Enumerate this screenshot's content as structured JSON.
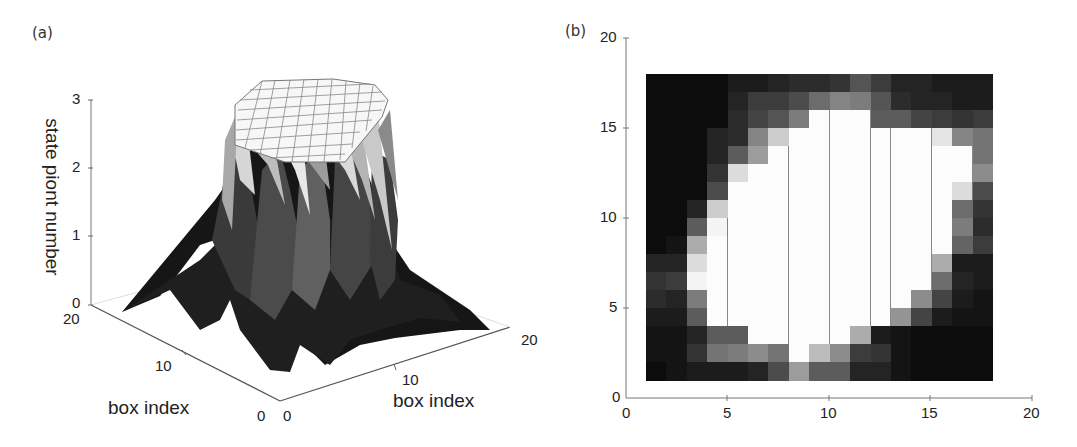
{
  "chart_data": [
    {
      "type": "surface3d",
      "panel": "(a)",
      "title": "",
      "xlabel": "box index",
      "ylabel": "box index",
      "zlabel": "state piont number",
      "x_ticks": [
        "0",
        "10",
        "20"
      ],
      "y_ticks": [
        "0",
        "10",
        "20"
      ],
      "z_ticks": [
        "0",
        "1",
        "2",
        "3"
      ],
      "xlim": [
        0,
        20
      ],
      "ylim": [
        0,
        20
      ],
      "zlim": [
        0,
        3
      ],
      "description": "3D mesh surface forming a flat-topped plateau at z=3 over the central region (approx boxes 5-15), falling steeply to 0 at the edges; grayscale shaded, grid lines visible on the plateau"
    },
    {
      "type": "heatmap",
      "panel": "(b)",
      "title": "",
      "xlabel": "",
      "ylabel": "",
      "x_ticks": [
        "0",
        "5",
        "10",
        "15",
        "20"
      ],
      "y_ticks": [
        "0",
        "5",
        "10",
        "15",
        "20"
      ],
      "xlim": [
        0,
        20
      ],
      "ylim": [
        0,
        20
      ],
      "cell_extent": {
        "x": [
          1,
          18
        ],
        "y": [
          1,
          18
        ]
      },
      "colormap": "gray (black=0, white=3)",
      "grid": true,
      "rows_top_to_bottom_y17_to_y1": [
        [
          0.0,
          0.0,
          0.0,
          0.0,
          0.2,
          0.2,
          0.3,
          0.4,
          0.4,
          0.5,
          0.9,
          0.6,
          0.3,
          0.3,
          0.2,
          0.2,
          0.2
        ],
        [
          0.0,
          0.0,
          0.0,
          0.0,
          0.3,
          0.6,
          0.6,
          0.8,
          1.2,
          1.5,
          1.4,
          0.9,
          0.4,
          0.3,
          0.3,
          0.2,
          0.2
        ],
        [
          0.0,
          0.0,
          0.0,
          0.0,
          0.4,
          0.7,
          0.9,
          1.4,
          3.0,
          3.0,
          3.0,
          1.0,
          1.0,
          0.7,
          0.6,
          0.5,
          0.6
        ],
        [
          0.0,
          0.0,
          0.0,
          0.3,
          0.4,
          1.5,
          2.4,
          3.0,
          3.0,
          3.0,
          3.0,
          3.0,
          3.0,
          3.0,
          2.7,
          1.5,
          1.3
        ],
        [
          0.0,
          0.0,
          0.0,
          0.3,
          1.0,
          1.8,
          3.0,
          3.0,
          3.0,
          3.0,
          3.0,
          3.0,
          3.0,
          3.0,
          3.0,
          3.0,
          1.3
        ],
        [
          0.0,
          0.0,
          0.0,
          0.5,
          2.6,
          3.0,
          3.0,
          3.0,
          3.0,
          3.0,
          3.0,
          3.0,
          3.0,
          3.0,
          3.0,
          3.0,
          1.6
        ],
        [
          0.0,
          0.0,
          0.0,
          0.8,
          3.0,
          3.0,
          3.0,
          3.0,
          3.0,
          3.0,
          3.0,
          3.0,
          3.0,
          3.0,
          3.0,
          2.6,
          0.8
        ],
        [
          0.0,
          0.0,
          0.3,
          2.4,
          3.0,
          3.0,
          3.0,
          3.0,
          3.0,
          3.0,
          3.0,
          3.0,
          3.0,
          3.0,
          3.0,
          1.2,
          0.5
        ],
        [
          0.0,
          0.0,
          1.0,
          2.9,
          3.0,
          3.0,
          3.0,
          3.0,
          3.0,
          3.0,
          3.0,
          3.0,
          3.0,
          3.0,
          3.0,
          1.4,
          0.4
        ],
        [
          0.0,
          0.1,
          2.0,
          3.0,
          3.0,
          3.0,
          3.0,
          3.0,
          3.0,
          3.0,
          3.0,
          3.0,
          3.0,
          3.0,
          3.0,
          1.1,
          0.6
        ],
        [
          0.3,
          0.3,
          2.6,
          3.0,
          3.0,
          3.0,
          3.0,
          3.0,
          3.0,
          3.0,
          3.0,
          3.0,
          3.0,
          3.0,
          2.0,
          0.2,
          0.2
        ],
        [
          0.5,
          0.6,
          2.9,
          3.0,
          3.0,
          3.0,
          3.0,
          3.0,
          3.0,
          3.0,
          3.0,
          3.0,
          3.0,
          3.0,
          1.2,
          0.3,
          0.2
        ],
        [
          0.4,
          0.3,
          1.4,
          3.0,
          3.0,
          3.0,
          3.0,
          3.0,
          3.0,
          3.0,
          3.0,
          3.0,
          3.0,
          1.6,
          0.7,
          0.2,
          0.1
        ],
        [
          0.2,
          0.2,
          1.0,
          3.0,
          3.0,
          3.0,
          3.0,
          3.0,
          3.0,
          3.0,
          3.0,
          3.0,
          1.7,
          0.7,
          0.2,
          0.1,
          0.1
        ],
        [
          0.1,
          0.1,
          0.3,
          1.0,
          1.0,
          3.0,
          3.0,
          3.0,
          3.0,
          3.0,
          2.0,
          0.2,
          0.1,
          0.0,
          0.0,
          0.0,
          0.0
        ],
        [
          0.1,
          0.1,
          0.5,
          1.3,
          1.4,
          1.6,
          1.3,
          3.0,
          2.2,
          1.6,
          0.6,
          0.5,
          0.1,
          0.0,
          0.0,
          0.0,
          0.0
        ],
        [
          0.0,
          0.1,
          0.2,
          0.2,
          0.2,
          0.3,
          0.8,
          1.8,
          1.0,
          1.0,
          0.3,
          0.3,
          0.1,
          0.0,
          0.0,
          0.0,
          0.0
        ]
      ]
    }
  ],
  "labels": {
    "panel_a": "(a)",
    "panel_b": "(b)",
    "a_zlabel": "state piont number",
    "a_xlabel": "box index",
    "a_ylabel": "box index",
    "a_z_ticks": [
      "0",
      "1",
      "2",
      "3"
    ],
    "a_left_ticks": [
      "20",
      "10",
      "0"
    ],
    "a_right_ticks": [
      "0",
      "10",
      "20"
    ],
    "b_x_ticks": [
      "0",
      "5",
      "10",
      "15",
      "20"
    ],
    "b_y_ticks": [
      "0",
      "5",
      "10",
      "15",
      "20"
    ]
  }
}
